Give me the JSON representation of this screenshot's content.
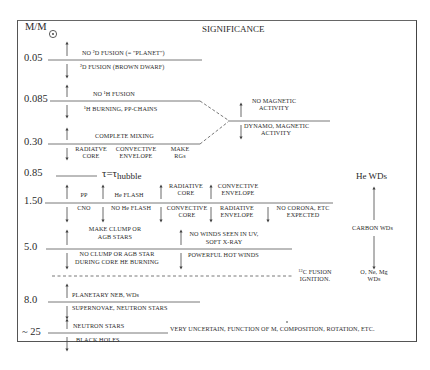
{
  "header": {
    "axis_label": "M/M",
    "sun_symbol": "sun-symbol",
    "title": "SIGNIFICANCE"
  },
  "mass_ticks": [
    "0.05",
    "0.085",
    "0.30",
    "0.85",
    "1.50",
    "5.0",
    "8.0",
    "~ 25"
  ],
  "rows": {
    "m005": {
      "above": "NO ²D FUSION    (= \"PLANET\")",
      "below": "²D FUSION    (BROWN DWARF)"
    },
    "m0085": {
      "above": "NO ¹H FUSION",
      "below": "¹H BURNING, PP-CHAINS"
    },
    "m030": {
      "above": "COMPLETE MIXING",
      "below_cols": [
        [
          "RADIATVE",
          "CORE"
        ],
        [
          "CONVECTIVE",
          "ENVELOPE"
        ],
        [
          "MAKE",
          "RGs"
        ]
      ]
    },
    "magnetic": {
      "above": [
        "NO MAGNETIC",
        "ACTIVITY"
      ],
      "below": [
        "DYNAMO, MAGNETIC",
        "ACTIVITY"
      ]
    },
    "m085": {
      "label": "τ=τ",
      "subscript": "hubble"
    },
    "m150": {
      "above": [
        "PP",
        "He FLASH",
        "RADIATIVE|CORE",
        "CONVECTIVE|ENVELOPE"
      ],
      "below": [
        "CNO",
        "NO He FLASH",
        "CONVECTIVE|CORE",
        "RADIATIVE|ENVELOPE",
        "NO CORONA, ETC|EXPECTED"
      ]
    },
    "m50": {
      "above_left": [
        "MAKE CLUMP OR",
        "AGB STARS"
      ],
      "below_left": [
        "NO CLUMP OR AGB STAR",
        "DURING  CORE HE BURNING"
      ],
      "above_right": [
        "NO WINDS SEEN IN UV,",
        "SOFT  X-RAY"
      ],
      "below_right": "POWERFUL HOT WINDS"
    },
    "carbon_ignition": {
      "sup": "12",
      "line1": "C FUSION",
      "line2": "IGNITION."
    },
    "m80": {
      "above": "PLANETARY NEB, WDs",
      "below": "SUPERNOVAE, NEUTRON STARS"
    },
    "m25": {
      "above": "NEUTRON STARS",
      "below": "BLACK HOLES",
      "note": "VERY UNCERTAIN,  FUNCTION OF M, COMPOSITION, ROTATION,  ETC."
    }
  },
  "white_dwarfs": {
    "top": "He WDs",
    "middle": "CARBON  WDs",
    "bottom": [
      "O, Ne,  Mg",
      "WDs"
    ]
  }
}
